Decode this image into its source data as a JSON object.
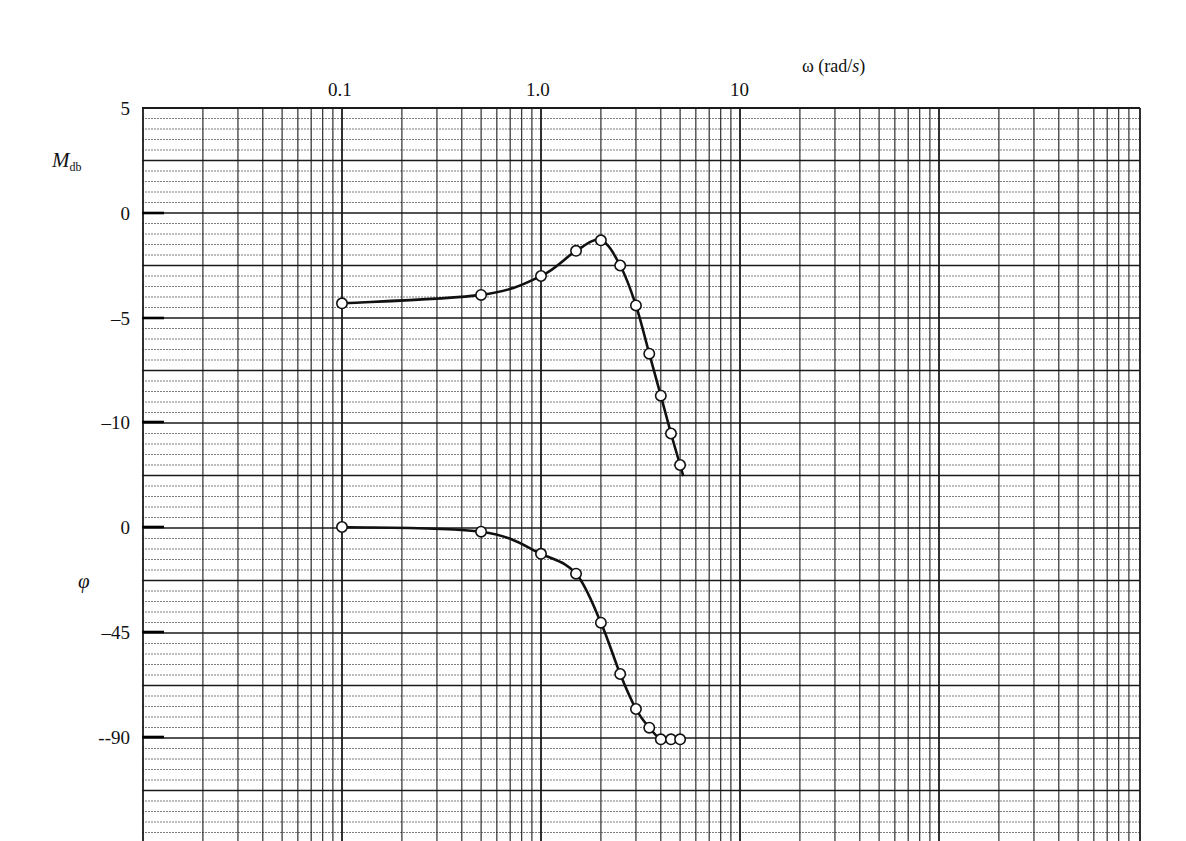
{
  "chart_data": {
    "type": "line",
    "title": "",
    "xlabel": "ω (rad/s)",
    "xscale": "log",
    "xlim": [
      0.01,
      1000
    ],
    "x_tick_labels": [
      "0.1",
      "1.0",
      "10"
    ],
    "x_ticks": [
      0.1,
      1.0,
      10
    ],
    "grid": true,
    "legend": null,
    "panels": [
      {
        "name": "magnitude",
        "ylabel": "M_db",
        "ylabel_main": "M",
        "ylabel_sub": "db",
        "ylim": [
          -15,
          5
        ],
        "y_ticks": [
          5,
          0,
          -5,
          -10
        ],
        "y_tick_labels": [
          "5",
          "0",
          "–5",
          "–10"
        ],
        "series": [
          {
            "name": "Magnitude (dB)",
            "marker": "open-circle",
            "x": [
              0.1,
              0.5,
              1.0,
              1.5,
              2.0,
              2.5,
              3.0,
              3.5,
              4.0,
              4.5,
              5.0
            ],
            "y": [
              -4.3,
              -3.9,
              -3.0,
              -1.8,
              -1.3,
              -2.5,
              -4.4,
              -6.7,
              -8.7,
              -10.5,
              -12.0
            ]
          }
        ]
      },
      {
        "name": "phase",
        "ylabel": "φ",
        "ylim": [
          -120,
          0
        ],
        "y_ticks": [
          0,
          -45,
          -90
        ],
        "y_tick_labels": [
          "0",
          "–45",
          "--90"
        ],
        "series": [
          {
            "name": "Phase (deg)",
            "marker": "open-circle",
            "x": [
              0.1,
              0.5,
              1.0,
              1.5,
              2.0,
              2.5,
              3.0,
              3.5,
              4.0,
              4.5,
              5.0
            ],
            "y": [
              0,
              -2,
              -11.5,
              -20,
              -41,
              -63,
              -78,
              -86,
              -91,
              -91,
              -91
            ]
          }
        ]
      }
    ]
  },
  "labels": {
    "x_axis_omega": "ω (rad/",
    "x_axis_s": "s",
    "x_axis_close": ")",
    "x_tick_0": "0.1",
    "x_tick_1": "1.0",
    "x_tick_2": "10",
    "mag_ylabel_main": "M",
    "mag_ylabel_sub": "db",
    "mag_tick_0": "5",
    "mag_tick_1": "0",
    "mag_tick_2": "–5",
    "mag_tick_3": "–10",
    "phase_ylabel": "φ",
    "phase_tick_0": "0",
    "phase_tick_1": "–45",
    "phase_tick_2": "--90"
  },
  "colors": {
    "grid_major": "#1a1a1a",
    "grid_minor": "#6e6e6e",
    "curve": "#111111",
    "marker_fill": "#ffffff"
  }
}
